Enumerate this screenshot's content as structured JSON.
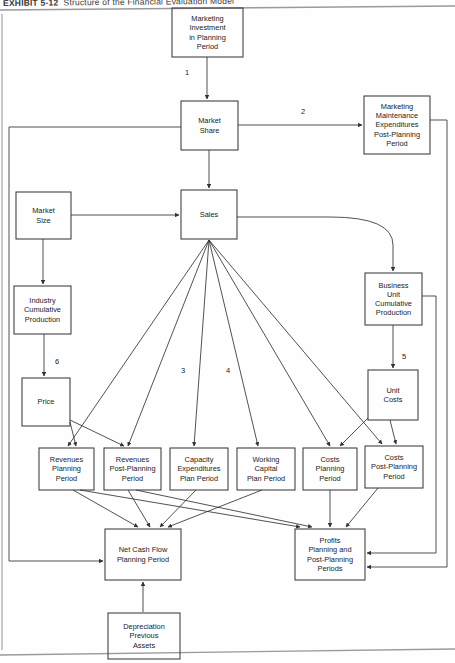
{
  "exhibit": {
    "number": "EXHIBIT 5-12",
    "caption": "Structure of the Financial Evaluation Model"
  },
  "diagram": {
    "type": "flowchart",
    "nodes": [
      {
        "id": "marketing_investment",
        "label": "Marketing\nInvestment\nin Planning\nPeriod",
        "x": 172,
        "y": 8,
        "w": 71,
        "h": 49
      },
      {
        "id": "market_share",
        "label": "Market\nShare",
        "x": 181,
        "y": 101,
        "w": 57,
        "h": 49
      },
      {
        "id": "marketing_maintenance",
        "label": "Marketing\nMaintenance\nExpenditures\nPost-Planning\nPeriod",
        "x": 364,
        "y": 96,
        "w": 66,
        "h": 58
      },
      {
        "id": "market_size",
        "label": "Market\nSize",
        "x": 16,
        "y": 192,
        "w": 55,
        "h": 47
      },
      {
        "id": "sales",
        "label": "Sales",
        "x": 181,
        "y": 190,
        "w": 56,
        "h": 49
      },
      {
        "id": "industry_cumulative",
        "label": "Industry\nCumulative\nProduction",
        "x": 14,
        "y": 286,
        "w": 57,
        "h": 48
      },
      {
        "id": "business_unit_cumulative",
        "label": "Business\nUnit\nCumulative\nProduction",
        "x": 365,
        "y": 273,
        "w": 57,
        "h": 52
      },
      {
        "id": "price",
        "label": "Price",
        "x": 22,
        "y": 378,
        "w": 48,
        "h": 48
      },
      {
        "id": "unit_costs",
        "label": "Unit\nCosts",
        "x": 368,
        "y": 370,
        "w": 50,
        "h": 50
      },
      {
        "id": "revenues_planning",
        "label": "Revenues\nPlanning\nPeriod",
        "x": 39,
        "y": 448,
        "w": 55,
        "h": 42
      },
      {
        "id": "revenues_post_planning",
        "label": "Revenues\nPost-Planning\nPeriod",
        "x": 104,
        "y": 448,
        "w": 57,
        "h": 42
      },
      {
        "id": "capacity_expenditures",
        "label": "Capacity\nExpenditures\nPlan Period",
        "x": 170,
        "y": 448,
        "w": 58,
        "h": 42
      },
      {
        "id": "working_capital",
        "label": "Working\nCapital\nPlan Period",
        "x": 237,
        "y": 448,
        "w": 58,
        "h": 42
      },
      {
        "id": "costs_planning",
        "label": "Costs\nPlanning\nPeriod",
        "x": 303,
        "y": 448,
        "w": 54,
        "h": 42
      },
      {
        "id": "costs_post_planning",
        "label": "Costs\nPost-Planning\nPeriod",
        "x": 365,
        "y": 446,
        "w": 58,
        "h": 42
      },
      {
        "id": "net_cash_flow",
        "label": "Net Cash Flow\nPlanning Period",
        "x": 105,
        "y": 529,
        "w": 76,
        "h": 51
      },
      {
        "id": "profits",
        "label": "Profits\nPlanning and\nPost-Planning\nPeriods",
        "x": 295,
        "y": 529,
        "w": 70,
        "h": 51
      },
      {
        "id": "depreciation",
        "label": "Depreciation\nPrevious\nAssets",
        "x": 108,
        "y": 613,
        "w": 72,
        "h": 46
      }
    ],
    "edge_labels": [
      {
        "id": "edge-label-1",
        "text": "1",
        "x": 180,
        "y": 68
      },
      {
        "id": "edge-label-2",
        "text": "2",
        "x": 296,
        "y": 107
      },
      {
        "id": "edge-label-3",
        "text": "3",
        "x": 176,
        "y": 366
      },
      {
        "id": "edge-label-4",
        "text": "4",
        "x": 221,
        "y": 366
      },
      {
        "id": "edge-label-5",
        "text": "5",
        "x": 397,
        "y": 352
      },
      {
        "id": "edge-label-6",
        "text": "6",
        "x": 50,
        "y": 357
      }
    ],
    "colors": {
      "line": "#333333",
      "box_border": "#3a3a3a",
      "text": "#1c1c1c",
      "rule": "#8a8a8a"
    }
  }
}
